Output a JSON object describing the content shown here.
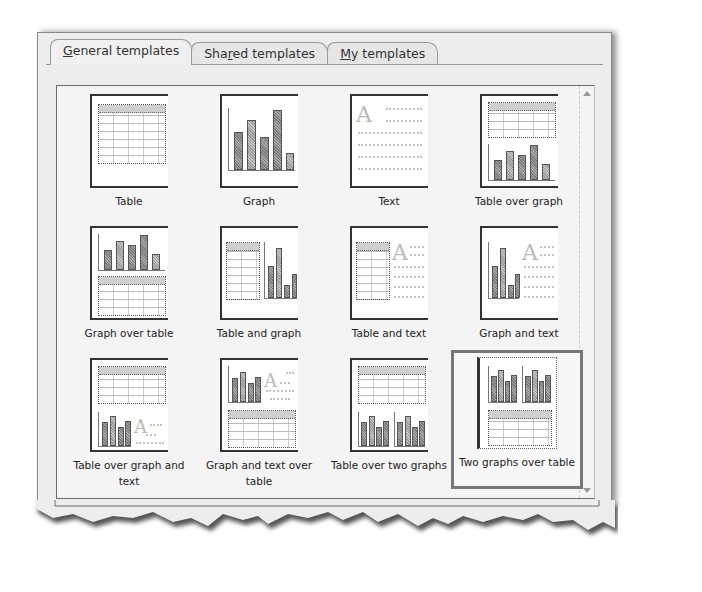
{
  "tabs": [
    {
      "label_pre": "",
      "label_key": "G",
      "label_post": "eneral templates",
      "active": true
    },
    {
      "label_pre": "Sha",
      "label_key": "r",
      "label_post": "ed templates",
      "active": false
    },
    {
      "label_pre": "",
      "label_key": "M",
      "label_post": "y templates",
      "active": false
    }
  ],
  "templates": [
    {
      "label": "Table",
      "layout": "table"
    },
    {
      "label": "Graph",
      "layout": "graph"
    },
    {
      "label": "Text",
      "layout": "text"
    },
    {
      "label": "Table over graph",
      "layout": "table-over-graph"
    },
    {
      "label": "Graph over table",
      "layout": "graph-over-table"
    },
    {
      "label": "Table and graph",
      "layout": "table-and-graph"
    },
    {
      "label": "Table and text",
      "layout": "table-and-text"
    },
    {
      "label": "Graph and text",
      "layout": "graph-and-text"
    },
    {
      "label": "Table over graph and text",
      "layout": "table-over-graph-and-text"
    },
    {
      "label": "Graph and text over table",
      "layout": "graph-and-text-over-table"
    },
    {
      "label": "Table over two graphs",
      "layout": "table-over-two-graphs"
    },
    {
      "label": "Two graphs over table",
      "layout": "two-graphs-over-table",
      "selected": true
    }
  ],
  "icons": {
    "text_glyph": "A",
    "scroll_up": "scroll-up-arrow",
    "scroll_down": "scroll-down-arrow"
  }
}
